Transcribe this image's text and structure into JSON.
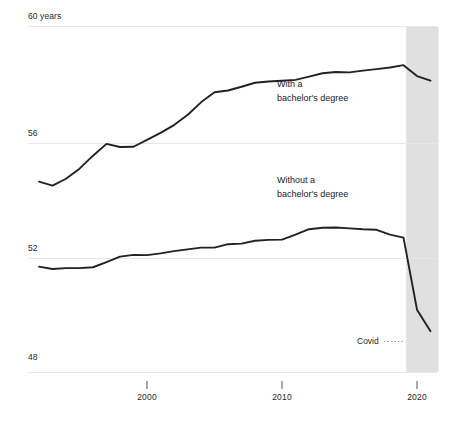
{
  "chart_data": {
    "type": "line",
    "title": "",
    "subtitle": "",
    "xlabel": "",
    "ylabel": "",
    "y_unit_label": "60 years",
    "xlim": [
      1992,
      2021
    ],
    "ylim": [
      48,
      60
    ],
    "yticks": [
      48,
      52,
      56,
      60
    ],
    "ytick_labels": [
      "48",
      "52",
      "56",
      "60 years"
    ],
    "xticks": [
      2000,
      2010,
      2020
    ],
    "xtick_labels": [
      "2000",
      "2010",
      "2020"
    ],
    "grid": "horizontal",
    "legend_position": "inline-annotations",
    "line_color": "#222222",
    "grid_color": "#e6e6e6",
    "shaded_band": {
      "label": "Covid",
      "x_start": 2019.2,
      "x_end": 2021.6,
      "color": "#e0e0e0"
    },
    "x": [
      1992,
      1993,
      1994,
      1995,
      1996,
      1997,
      1998,
      1999,
      2000,
      2001,
      2002,
      2003,
      2004,
      2005,
      2006,
      2007,
      2008,
      2009,
      2010,
      2011,
      2012,
      2013,
      2014,
      2015,
      2016,
      2017,
      2018,
      2019,
      2020,
      2021
    ],
    "series": [
      {
        "name": "With a bachelor's degree",
        "label_line1": "With a",
        "label_line2": "bachelor's degree",
        "values": [
          54.62,
          54.48,
          54.72,
          55.07,
          55.52,
          55.93,
          55.82,
          55.83,
          56.07,
          56.31,
          56.58,
          56.93,
          57.37,
          57.72,
          57.78,
          57.91,
          58.05,
          58.09,
          58.12,
          58.15,
          58.26,
          58.38,
          58.42,
          58.41,
          58.47,
          58.52,
          58.58,
          58.66,
          58.28,
          58.12
        ]
      },
      {
        "name": "Without a bachelor's degree",
        "label_line1": "Without a",
        "label_line2": "bachelor's degree",
        "values": [
          51.67,
          51.59,
          51.62,
          51.62,
          51.65,
          51.83,
          52.02,
          52.08,
          52.07,
          52.13,
          52.21,
          52.27,
          52.33,
          52.33,
          52.45,
          52.47,
          52.57,
          52.6,
          52.61,
          52.78,
          52.97,
          53.02,
          53.03,
          53.0,
          52.97,
          52.95,
          52.78,
          52.66,
          52.63,
          52.68
        ]
      }
    ],
    "covid_dropoff": {
      "with_degree": [
        58.66,
        58.28,
        58.12
      ],
      "without_degree": [
        52.68,
        50.18,
        49.43
      ]
    }
  },
  "axis": {
    "y_top_label": "60 years",
    "y_labels": [
      "60 years",
      "56",
      "52",
      "48"
    ],
    "x_labels": [
      "2000",
      "2010",
      "2020"
    ]
  },
  "annotations": {
    "upper": {
      "line1": "With a",
      "line2": "bachelor's degree"
    },
    "lower": {
      "line1": "Without a",
      "line2": "bachelor's degree"
    },
    "covid": {
      "label": "Covid"
    }
  }
}
